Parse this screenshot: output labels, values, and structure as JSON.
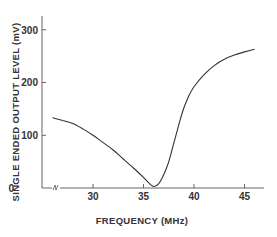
{
  "chart_data": {
    "type": "line",
    "title": "",
    "xlabel": "FREQUENCY (MHz)",
    "ylabel": "SINGLE ENDED OUTPUT LEVEL (mV)",
    "xlim": [
      26,
      47
    ],
    "ylim": [
      0,
      320
    ],
    "x_ticks": [
      "30",
      "35",
      "40",
      "45"
    ],
    "y_ticks": [
      "0",
      "100",
      "200",
      "300"
    ],
    "grid": false,
    "legend": null,
    "axis_break": true,
    "series": [
      {
        "name": "Output level",
        "x": [
          26,
          27,
          28,
          29,
          30,
          31,
          32,
          33,
          34,
          35,
          35.5,
          36,
          36.5,
          37,
          37.5,
          38,
          38.5,
          39,
          39.5,
          40,
          41,
          42,
          43,
          44,
          45,
          46
        ],
        "values": [
          133,
          128,
          122,
          112,
          100,
          86,
          72,
          55,
          38,
          20,
          10,
          3,
          8,
          25,
          50,
          85,
          120,
          152,
          175,
          192,
          215,
          232,
          244,
          252,
          258,
          263
        ]
      }
    ]
  }
}
